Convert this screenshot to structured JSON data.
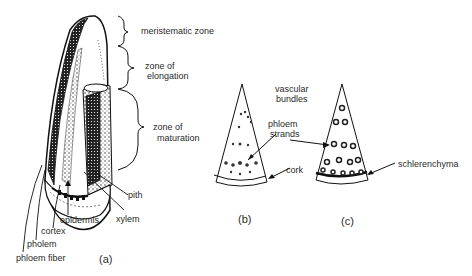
{
  "figure": {
    "panel_a": {
      "caption": "(a)",
      "zone_labels": {
        "meristematic": "meristematic zone",
        "elongation_1": "zone of",
        "elongation_2": "elongation",
        "maturation_1": "zone of",
        "maturation_2": "maturation"
      },
      "tissue_labels": {
        "pith": "pith",
        "xylem": "xylem",
        "epidermis": "epidermis",
        "cortex": "cortex",
        "pholem": "pholem",
        "phloem_fiber": "phloem fiber"
      }
    },
    "panel_b": {
      "caption": "(b)",
      "labels": {
        "vascular_1": "vascular",
        "vascular_2": "bundles",
        "phloem_1": "phloem",
        "phloem_2": "strands",
        "cork": "cork"
      }
    },
    "panel_c": {
      "caption": "(c)",
      "labels": {
        "schlerenchyma": "schlerenchyma"
      }
    }
  }
}
